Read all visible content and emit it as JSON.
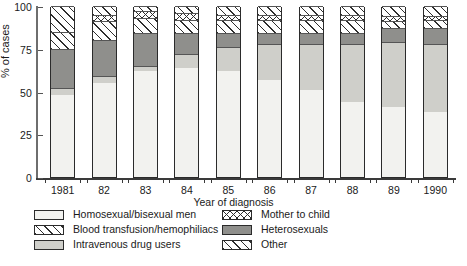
{
  "chart_data": {
    "type": "bar",
    "title": "",
    "xlabel": "Year of diagnosis",
    "ylabel": "% of cases",
    "ylim": [
      0,
      100
    ],
    "yticks": [
      0,
      25,
      50,
      75,
      100
    ],
    "grid": false,
    "legend_position": "bottom",
    "stacked": true,
    "stack_order": [
      "Homosexual/bisexual men",
      "Intravenous drug users",
      "Heterosexuals",
      "Blood transfusion/hemophiliacs",
      "Mother to child",
      "Other"
    ],
    "categories": [
      "1981",
      "82",
      "83",
      "84",
      "85",
      "86",
      "87",
      "88",
      "89",
      "1990"
    ],
    "series": [
      {
        "name": "Homosexual/bisexual men",
        "pattern": "solid-very-light",
        "color": "#f2f2ef",
        "values": [
          48,
          55,
          62,
          64,
          62,
          57,
          51,
          44,
          41,
          38
        ]
      },
      {
        "name": "Intravenous drug users",
        "pattern": "solid-light-gray",
        "color": "#cfcfca",
        "values": [
          4,
          4,
          3,
          8,
          14,
          21,
          27,
          34,
          38,
          40
        ]
      },
      {
        "name": "Heterosexuals",
        "pattern": "solid-dark-gray",
        "color": "#8f8f8c",
        "values": [
          23,
          21,
          19,
          12,
          8,
          6,
          6,
          6,
          8,
          9
        ]
      },
      {
        "name": "Blood transfusion/hemophiliacs",
        "pattern": "diagonal-hatch",
        "color": "#ffffff",
        "values": [
          10,
          11,
          9,
          8,
          8,
          8,
          8,
          8,
          4,
          5
        ]
      },
      {
        "name": "Mother to child",
        "pattern": "cross-hatch",
        "color": "#ffffff",
        "values": [
          0,
          4,
          4,
          4,
          3,
          3,
          3,
          3,
          3,
          2
        ]
      },
      {
        "name": "Other",
        "pattern": "diagonal-hatch",
        "color": "#ffffff",
        "values": [
          15,
          5,
          3,
          4,
          5,
          5,
          5,
          5,
          6,
          6
        ]
      }
    ]
  },
  "axes": {
    "y_label": "% of cases",
    "y_ticks": [
      "0",
      "25",
      "50",
      "75",
      "100"
    ],
    "x_label": "Year of diagnosis",
    "x_ticks": [
      "1981",
      "82",
      "83",
      "84",
      "85",
      "86",
      "87",
      "88",
      "89",
      "1990"
    ]
  },
  "legend": {
    "left_column": [
      {
        "label": "Homosexual/bisexual men",
        "swatch": "solid-very-light"
      },
      {
        "label": "Blood transfusion/hemophiliacs",
        "swatch": "diagonal-hatch"
      },
      {
        "label": "Intravenous drug users",
        "swatch": "solid-light-gray"
      }
    ],
    "right_column": [
      {
        "label": "Mother to child",
        "swatch": "cross-hatch"
      },
      {
        "label": "Heterosexuals",
        "swatch": "solid-dark-gray"
      },
      {
        "label": "Other",
        "swatch": "diagonal-hatch"
      }
    ]
  },
  "footnote": {
    "text": ""
  }
}
